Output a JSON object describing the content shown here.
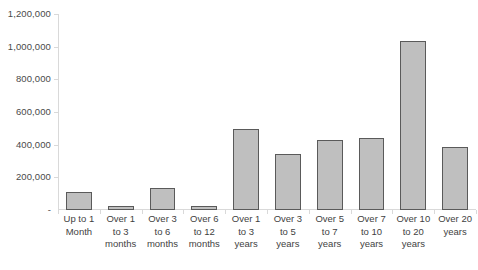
{
  "chart_data": {
    "type": "bar",
    "title": "",
    "subtitle": "",
    "xlabel": "",
    "ylabel": "",
    "ylim": [
      0,
      1200000
    ],
    "ytick_values": [
      0,
      200000,
      400000,
      600000,
      800000,
      1000000,
      1200000
    ],
    "ytick_labels": [
      "-",
      "200,000",
      "400,000",
      "600,000",
      "800,000",
      "1,000,000",
      "1,200,000"
    ],
    "grid": false,
    "legend": null,
    "legend_position": "none",
    "categories": [
      "Up to 1 Month",
      "Over 1 to 3 months",
      "Over 3 to 6 months",
      "Over 6 to 12 months",
      "Over 1 to 3 years",
      "Over 3 to 5 years",
      "Over 5 to 7 years",
      "Over 7 to 10 years",
      "Over 10 to 20 years",
      "Over 20 years"
    ],
    "category_label_lines": [
      [
        "Up to 1",
        "Month"
      ],
      [
        "Over 1",
        "to 3",
        "months"
      ],
      [
        "Over 3",
        "to 6",
        "months"
      ],
      [
        "Over 6",
        "to 12",
        "months"
      ],
      [
        "Over 1",
        "to 3",
        "years"
      ],
      [
        "Over 3",
        "to 5",
        "years"
      ],
      [
        "Over 5",
        "to 7",
        "years"
      ],
      [
        "Over 7",
        "to 10",
        "years"
      ],
      [
        "Over 10",
        "to 20",
        "years"
      ],
      [
        "Over 20",
        "years"
      ]
    ],
    "values": [
      110000,
      25000,
      135000,
      25000,
      495000,
      340000,
      430000,
      440000,
      1035000,
      385000
    ],
    "colors": {
      "bar_fill": "#bfbfbf",
      "bar_border": "#5a5a5a",
      "axis": "#d9d9d9",
      "text": "#3f3f3f",
      "background": "#ffffff"
    }
  }
}
